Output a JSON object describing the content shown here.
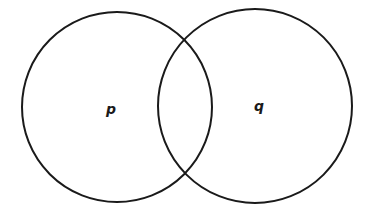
{
  "diagram": {
    "type": "venn",
    "sets": [
      {
        "label": "p",
        "cx": 117,
        "cy": 107,
        "r": 95
      },
      {
        "label": "q",
        "cx": 255,
        "cy": 106,
        "r": 97
      }
    ],
    "stroke_color": "#1a1a1a",
    "background": "#ffffff"
  }
}
